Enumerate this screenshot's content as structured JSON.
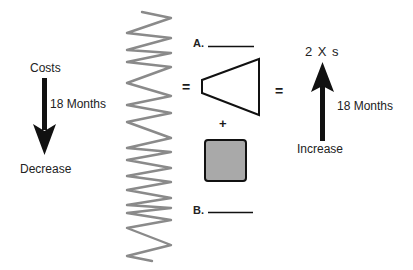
{
  "diagram": {
    "left": {
      "top_label": "Costs",
      "duration_label": "18 Months",
      "bottom_label": "Decrease",
      "arrow_direction": "down"
    },
    "middle": {
      "label_a": "A.",
      "label_b": "B.",
      "operators": {
        "equals_1": "=",
        "plus": "+",
        "equals_2": "="
      },
      "shapes": [
        "spring",
        "trapezoid",
        "gray-square"
      ]
    },
    "right": {
      "top_label": "2 X s",
      "duration_label": "18 Months",
      "bottom_label": "Increase",
      "arrow_direction": "up"
    },
    "colors": {
      "ink": "#111111",
      "spring": "#8a8a8a",
      "square_fill": "#a9a9a9"
    }
  }
}
